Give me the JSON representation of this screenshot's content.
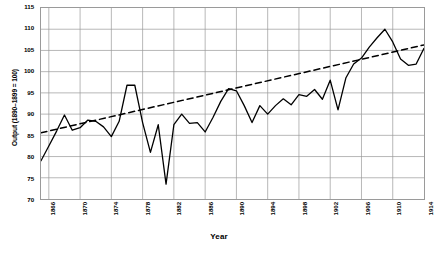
{
  "chart_data": {
    "type": "line",
    "title": "",
    "xlabel": "Year",
    "ylabel": "Output (1890–1899 = 100)",
    "xlim": [
      1865,
      1914
    ],
    "ylim": [
      70,
      115
    ],
    "ytick_step": 5,
    "xtick_step": 4,
    "grid": true,
    "legend": "none",
    "yticks": [
      70,
      75,
      80,
      85,
      90,
      95,
      100,
      105,
      110,
      115
    ],
    "xticks": [
      1866,
      1870,
      1874,
      1878,
      1882,
      1886,
      1890,
      1894,
      1898,
      1902,
      1906,
      1910,
      1914
    ],
    "series": [
      {
        "name": "Output index",
        "style": "solid",
        "color": "#000000",
        "x": [
          1865,
          1866,
          1867,
          1868,
          1869,
          1870,
          1871,
          1872,
          1873,
          1874,
          1875,
          1876,
          1877,
          1878,
          1879,
          1880,
          1881,
          1882,
          1883,
          1884,
          1885,
          1886,
          1887,
          1888,
          1889,
          1890,
          1891,
          1892,
          1893,
          1894,
          1895,
          1896,
          1897,
          1898,
          1899,
          1900,
          1901,
          1902,
          1903,
          1904,
          1905,
          1906,
          1907,
          1908,
          1909,
          1910,
          1911,
          1912,
          1913,
          1914
        ],
        "values": [
          79.0,
          82.5,
          86.0,
          89.8,
          86.2,
          86.8,
          88.6,
          88.3,
          87.0,
          84.7,
          88.3,
          96.8,
          96.8,
          88.0,
          81.0,
          87.5,
          73.5,
          87.5,
          90.0,
          87.8,
          88.0,
          85.8,
          89.2,
          93.0,
          96.0,
          95.5,
          92.0,
          88.0,
          92.0,
          90.0,
          92.0,
          93.6,
          92.2,
          94.6,
          94.2,
          95.8,
          93.5,
          98.0,
          91.0,
          98.5,
          101.8,
          103.2,
          105.8,
          108.0,
          110.0,
          107.0,
          103.0,
          101.5,
          101.8,
          105.5
        ]
      },
      {
        "name": "Trend",
        "style": "dashed",
        "color": "#000000",
        "x": [
          1865,
          1914
        ],
        "values": [
          85.6,
          106.3
        ]
      }
    ]
  },
  "axes": {
    "y_title": "Output (1890–1899 = 100)",
    "x_title": "Year"
  }
}
